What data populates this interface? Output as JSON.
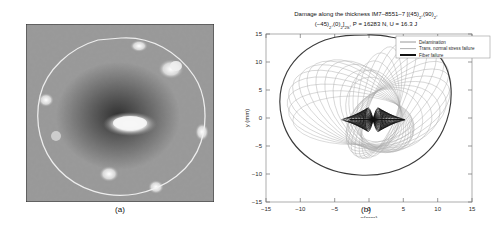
{
  "figure": {
    "panel_a": {
      "caption": "(a)",
      "type": "ultrasonic-c-scan",
      "description": "grayscale noisy c-scan with white delamination outline and bright central indentation blob"
    },
    "panel_b": {
      "caption": "(b)",
      "title_line1": "Damage along the thickness IM7–8551–7 [(45)",
      "title_line1_sub1": "2",
      "title_line1_mid": ",(90)",
      "title_line1_sub2": "2",
      "title_line2_pre": "(−45)",
      "title_line2_sub1": "2",
      "title_line2_mid": ",(0)",
      "title_line2_sub2": "2",
      "title_line2_close": "]",
      "title_line2_sub3": "2S",
      "title_line2_post": ", P = 16283 N, U = 16.3 J",
      "legend": [
        {
          "label": "Delamination",
          "color": "#8c8c8c",
          "width": 0.9
        },
        {
          "label": "Trans. normal stress failure",
          "color": "#a8a8a8",
          "width": 0.9
        },
        {
          "label": "Fiber failure",
          "color": "#111111",
          "width": 2.0
        }
      ]
    }
  },
  "chart_data": {
    "type": "line",
    "xlabel": "x(mm)",
    "ylabel": "y (mm)",
    "xlim": [
      -15,
      15
    ],
    "ylim": [
      -15,
      15
    ],
    "xticks": [
      -15,
      -10,
      -5,
      0,
      5,
      10,
      15
    ],
    "yticks": [
      -15,
      -10,
      -5,
      0,
      5,
      10,
      15
    ],
    "grid": false,
    "legend_position": "upper-right-outside",
    "series": [
      {
        "name": "Delamination",
        "kind": "closed-outline",
        "color": "#8c8c8c",
        "points": [
          [
            -0.2,
            12.3
          ],
          [
            2.0,
            12.5
          ],
          [
            3.6,
            11.9
          ],
          [
            5.2,
            12.2
          ],
          [
            6.6,
            11.2
          ],
          [
            8.2,
            11.0
          ],
          [
            9.6,
            9.8
          ],
          [
            10.8,
            8.4
          ],
          [
            11.6,
            6.6
          ],
          [
            12.1,
            4.6
          ],
          [
            12.3,
            2.4
          ],
          [
            12.1,
            0.2
          ],
          [
            11.7,
            -2.0
          ],
          [
            11.0,
            -4.0
          ],
          [
            10.0,
            -5.9
          ],
          [
            8.7,
            -7.5
          ],
          [
            7.1,
            -8.8
          ],
          [
            5.3,
            -9.8
          ],
          [
            3.3,
            -10.5
          ],
          [
            1.2,
            -10.9
          ],
          [
            -0.9,
            -11.0
          ],
          [
            -3.0,
            -10.8
          ],
          [
            -5.0,
            -10.3
          ],
          [
            -6.9,
            -9.4
          ],
          [
            -8.5,
            -8.2
          ],
          [
            -9.8,
            -6.7
          ],
          [
            -10.8,
            -4.9
          ],
          [
            -11.4,
            -2.9
          ],
          [
            -11.6,
            -0.8
          ],
          [
            -11.4,
            1.4
          ],
          [
            -10.9,
            3.5
          ],
          [
            -10.0,
            5.4
          ],
          [
            -8.8,
            7.1
          ],
          [
            -7.3,
            8.6
          ],
          [
            -5.5,
            9.8
          ],
          [
            -3.6,
            10.9
          ],
          [
            -1.8,
            11.8
          ]
        ]
      },
      {
        "name": "Trans. normal stress failure",
        "kind": "rotated-ellipse-family",
        "color": "#a6a6a6",
        "count": 28,
        "center": [
          1.2,
          -0.4
        ],
        "semi_major_range": [
          2.0,
          9.6
        ],
        "semi_minor_range": [
          1.2,
          5.6
        ],
        "angle_range_deg": [
          0,
          180
        ]
      },
      {
        "name": "Fiber failure",
        "kind": "bowtie-cluster",
        "color": "#111111",
        "center": [
          0.6,
          -0.3
        ],
        "extent_x": [
          -3.4,
          4.6
        ],
        "extent_y": [
          -2.6,
          2.6
        ]
      }
    ]
  }
}
